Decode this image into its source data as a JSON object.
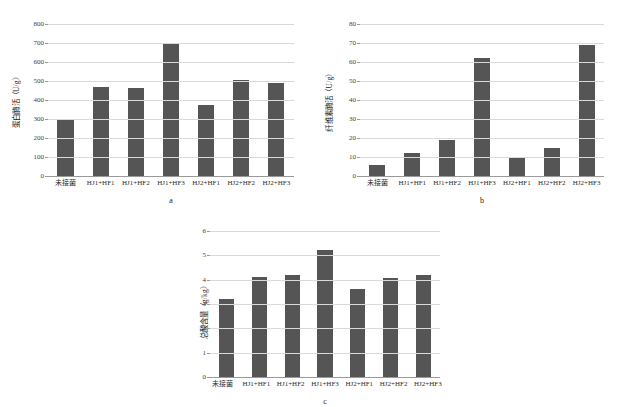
{
  "figure": {
    "background": "#ffffff",
    "bar_color": "#555555",
    "gridline_color": "#d9d9d9",
    "axis_color": "#9a9a9a"
  },
  "panels": [
    {
      "id": "panel-a",
      "caption": "a",
      "chart_data": {
        "type": "bar",
        "title": "",
        "xlabel": "",
        "ylabel": "蛋白酶活（U/g）",
        "ylim": [
          0,
          800
        ],
        "ytick_step": 100,
        "yticks": [
          "0",
          "100",
          "200",
          "300",
          "400",
          "500",
          "600",
          "700",
          "800"
        ],
        "grid": true,
        "legend": "none",
        "categories": [
          "未接菌",
          "HJ1+HF1",
          "HJ1+HF2",
          "HJ1+HF3",
          "HJ2+HF1",
          "HJ2+HF2",
          "HJ2+HF3"
        ],
        "values": [
          299,
          470,
          464,
          693,
          375,
          506,
          487
        ]
      }
    },
    {
      "id": "panel-b",
      "caption": "b",
      "chart_data": {
        "type": "bar",
        "title": "",
        "xlabel": "",
        "ylabel": "纤维素酶活（U/g）",
        "ylim": [
          0,
          80
        ],
        "ytick_step": 10,
        "yticks": [
          "0",
          "10",
          "20",
          "30",
          "40",
          "50",
          "60",
          "70",
          "80"
        ],
        "grid": true,
        "legend": "none",
        "categories": [
          "未接菌",
          "HJ1+HF1",
          "HJ1+HF2",
          "HJ1+HF3",
          "HJ2+HF1",
          "HJ2+HF2",
          "HJ2+HF3"
        ],
        "values": [
          6,
          12,
          19,
          62,
          10,
          15,
          69
        ]
      }
    },
    {
      "id": "panel-c",
      "caption": "c",
      "chart_data": {
        "type": "bar",
        "title": "",
        "xlabel": "",
        "ylabel": "总酸含量（g/kg）",
        "ylim": [
          0,
          6
        ],
        "ytick_step": 1,
        "yticks": [
          "0",
          "1",
          "2",
          "3",
          "4",
          "5",
          "6"
        ],
        "grid": true,
        "legend": "none",
        "categories": [
          "未接菌",
          "HJ1+HF1",
          "HJ1+HF2",
          "HJ1+HF3",
          "HJ2+HF1",
          "HJ2+HF2",
          "HJ2+HF3"
        ],
        "values": [
          3.2,
          4.12,
          4.2,
          5.2,
          3.6,
          4.08,
          4.18
        ]
      }
    }
  ]
}
